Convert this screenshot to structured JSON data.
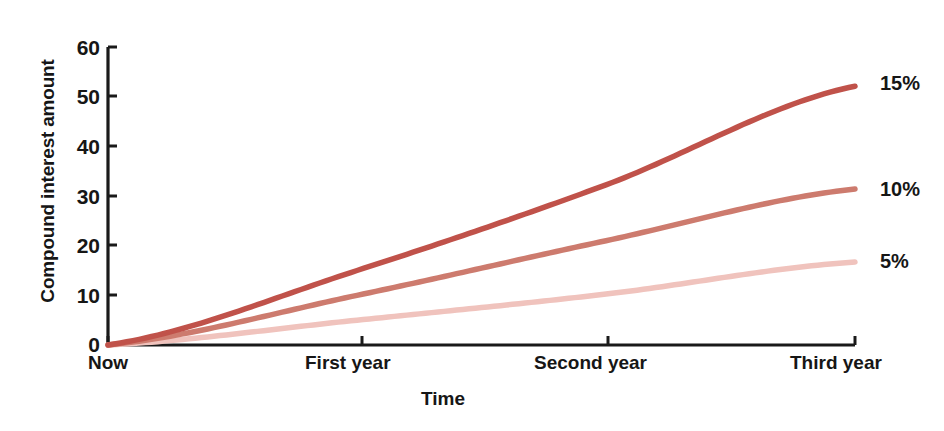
{
  "chart_data": {
    "type": "line",
    "title": "",
    "xlabel": "Time",
    "ylabel": "Compound interest amount",
    "categories": [
      "Now",
      "First year",
      "Second year",
      "Third year"
    ],
    "x": [
      0,
      1,
      2,
      3
    ],
    "xtick_labels": [
      "Now",
      "First year",
      "Second year",
      "Third year"
    ],
    "ytick_labels": [
      "0",
      "10",
      "20",
      "30",
      "40",
      "50",
      "60"
    ],
    "yticks": [
      0,
      10,
      20,
      30,
      40,
      50,
      60
    ],
    "ylim": [
      0,
      60
    ],
    "xlim": [
      0,
      3
    ],
    "grid": false,
    "legend_position": "right-end-of-line",
    "series": [
      {
        "name": "15%",
        "label": "15%",
        "color": "#c0524a",
        "values": [
          0,
          15,
          32.25,
          52.1
        ]
      },
      {
        "name": "10%",
        "label": "10%",
        "color": "#cd7b6e",
        "values": [
          0,
          10,
          21,
          31.4
        ]
      },
      {
        "name": "5%",
        "label": "5%",
        "color": "#f0c3bd",
        "values": [
          0,
          5,
          10.25,
          16.7
        ]
      }
    ]
  },
  "axis": {
    "ylabel": "Compound interest amount",
    "xlabel": "Time",
    "yticks": [
      "60",
      "50",
      "40",
      "30",
      "20",
      "10",
      "0"
    ],
    "xticks": [
      "Now",
      "First year",
      "Second year",
      "Third year"
    ],
    "axis_color": "#1a1a1a"
  },
  "series_labels": {
    "high": "15%",
    "mid": "10%",
    "low": "5%"
  }
}
